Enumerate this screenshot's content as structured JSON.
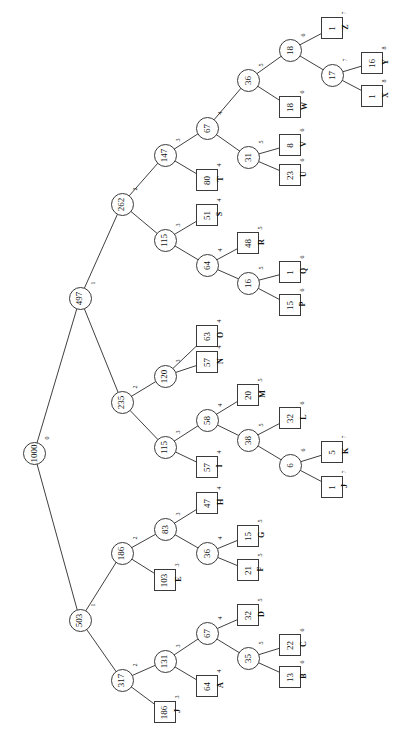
{
  "diagram": {
    "orientation": "rotated-90-ccw",
    "node_stroke": "#3a3a3a",
    "edge_stroke": "#2a2a2a",
    "background": "#ffffff",
    "text_color": "#111111"
  },
  "chart_data": {
    "type": "tree",
    "title": "",
    "root": "1000",
    "internal_shape": "circle",
    "leaf_shape": "square",
    "depth_label_note": "superscript number next to each node is its depth level",
    "nodes": [
      {
        "id": "n0",
        "value": "1000",
        "depth": "0",
        "kind": "internal",
        "x": 34,
        "y": 453
      },
      {
        "id": "n1",
        "value": "497",
        "depth": "1",
        "kind": "internal",
        "x": 80,
        "y": 298
      },
      {
        "id": "n2",
        "value": "503",
        "depth": "1",
        "kind": "internal",
        "x": 80,
        "y": 620
      },
      {
        "id": "n3",
        "value": "262",
        "depth": "2",
        "kind": "internal",
        "x": 122,
        "y": 204
      },
      {
        "id": "n4",
        "value": "235",
        "depth": "2",
        "kind": "internal",
        "x": 122,
        "y": 402
      },
      {
        "id": "n5",
        "value": "186",
        "depth": "2",
        "kind": "internal",
        "x": 122,
        "y": 553
      },
      {
        "id": "n6",
        "value": "317",
        "depth": "2",
        "kind": "internal",
        "x": 122,
        "y": 680
      },
      {
        "id": "n7",
        "value": "147",
        "depth": "3",
        "kind": "internal",
        "x": 165,
        "y": 155
      },
      {
        "id": "n8",
        "value": "115",
        "depth": "3",
        "kind": "internal",
        "x": 165,
        "y": 240
      },
      {
        "id": "n9",
        "value": "120",
        "depth": "3",
        "kind": "internal",
        "x": 165,
        "y": 376
      },
      {
        "id": "n10",
        "value": "115",
        "depth": "3",
        "kind": "internal",
        "x": 165,
        "y": 447
      },
      {
        "id": "n11",
        "value": "83",
        "depth": "3",
        "kind": "internal",
        "x": 165,
        "y": 529
      },
      {
        "id": "n12",
        "value": "103",
        "depth": "3",
        "kind": "leaf",
        "x": 165,
        "y": 580
      },
      {
        "id": "n13",
        "value": "131",
        "depth": "3",
        "kind": "internal",
        "x": 165,
        "y": 661
      },
      {
        "id": "n14",
        "value": "186",
        "depth": "3",
        "kind": "leaf",
        "x": 165,
        "y": 712
      },
      {
        "id": "n15",
        "value": "67",
        "depth": "4",
        "kind": "internal",
        "x": 207,
        "y": 128
      },
      {
        "id": "n16",
        "value": "80",
        "depth": "4",
        "kind": "leaf",
        "x": 207,
        "y": 180
      },
      {
        "id": "n17",
        "value": "51",
        "depth": "4",
        "kind": "leaf",
        "x": 207,
        "y": 215
      },
      {
        "id": "n18",
        "value": "64",
        "depth": "4",
        "kind": "internal",
        "x": 207,
        "y": 265
      },
      {
        "id": "n19",
        "value": "63",
        "depth": "4",
        "kind": "leaf",
        "x": 207,
        "y": 336
      },
      {
        "id": "n20",
        "value": "57",
        "depth": "4",
        "kind": "leaf",
        "x": 207,
        "y": 362
      },
      {
        "id": "n21",
        "value": "58",
        "depth": "4",
        "kind": "internal",
        "x": 207,
        "y": 420
      },
      {
        "id": "n22",
        "value": "57",
        "depth": "4",
        "kind": "leaf",
        "x": 207,
        "y": 467
      },
      {
        "id": "n23",
        "value": "47",
        "depth": "4",
        "kind": "leaf",
        "x": 207,
        "y": 503
      },
      {
        "id": "n24",
        "value": "36",
        "depth": "4",
        "kind": "internal",
        "x": 207,
        "y": 553
      },
      {
        "id": "n25",
        "value": "67",
        "depth": "4",
        "kind": "internal",
        "x": 207,
        "y": 633
      },
      {
        "id": "n26",
        "value": "64",
        "depth": "4",
        "kind": "leaf",
        "x": 207,
        "y": 686
      },
      {
        "id": "n27",
        "value": "36",
        "depth": "5",
        "kind": "internal",
        "x": 248,
        "y": 80
      },
      {
        "id": "n28",
        "value": "31",
        "depth": "5",
        "kind": "internal",
        "x": 248,
        "y": 157
      },
      {
        "id": "n29",
        "value": "48",
        "depth": "5",
        "kind": "leaf",
        "x": 248,
        "y": 243
      },
      {
        "id": "n30",
        "value": "16",
        "depth": "5",
        "kind": "internal",
        "x": 248,
        "y": 283
      },
      {
        "id": "n31",
        "value": "20",
        "depth": "5",
        "kind": "leaf",
        "x": 248,
        "y": 395
      },
      {
        "id": "n32",
        "value": "38",
        "depth": "5",
        "kind": "internal",
        "x": 248,
        "y": 440
      },
      {
        "id": "n33",
        "value": "15",
        "depth": "5",
        "kind": "leaf",
        "x": 248,
        "y": 536
      },
      {
        "id": "n34",
        "value": "21",
        "depth": "5",
        "kind": "leaf",
        "x": 248,
        "y": 570
      },
      {
        "id": "n35",
        "value": "32",
        "depth": "5",
        "kind": "leaf",
        "x": 248,
        "y": 615
      },
      {
        "id": "n36",
        "value": "35",
        "depth": "5",
        "kind": "internal",
        "x": 248,
        "y": 658
      },
      {
        "id": "n37",
        "value": "18",
        "depth": "6",
        "kind": "internal",
        "x": 290,
        "y": 50
      },
      {
        "id": "n38",
        "value": "18",
        "depth": "6",
        "kind": "leaf",
        "x": 290,
        "y": 107
      },
      {
        "id": "n39",
        "value": "8",
        "depth": "6",
        "kind": "leaf",
        "x": 290,
        "y": 145
      },
      {
        "id": "n40",
        "value": "23",
        "depth": "6",
        "kind": "leaf",
        "x": 290,
        "y": 175
      },
      {
        "id": "n41",
        "value": "1",
        "depth": "6",
        "kind": "leaf",
        "x": 290,
        "y": 272
      },
      {
        "id": "n42",
        "value": "15",
        "depth": "6",
        "kind": "leaf",
        "x": 290,
        "y": 305
      },
      {
        "id": "n43",
        "value": "32",
        "depth": "6",
        "kind": "leaf",
        "x": 290,
        "y": 418
      },
      {
        "id": "n44",
        "value": "6",
        "depth": "6",
        "kind": "internal",
        "x": 290,
        "y": 465
      },
      {
        "id": "n45",
        "value": "22",
        "depth": "6",
        "kind": "leaf",
        "x": 290,
        "y": 645
      },
      {
        "id": "n46",
        "value": "13",
        "depth": "6",
        "kind": "leaf",
        "x": 290,
        "y": 677
      },
      {
        "id": "n47",
        "value": "1",
        "depth": "7",
        "kind": "leaf",
        "x": 332,
        "y": 28
      },
      {
        "id": "n48",
        "value": "17",
        "depth": "7",
        "kind": "internal",
        "x": 332,
        "y": 75
      },
      {
        "id": "n49",
        "value": "5",
        "depth": "7",
        "kind": "leaf",
        "x": 332,
        "y": 452
      },
      {
        "id": "n50",
        "value": "1",
        "depth": "7",
        "kind": "leaf",
        "x": 332,
        "y": 487
      },
      {
        "id": "n51",
        "value": "16",
        "depth": "8",
        "kind": "leaf",
        "x": 372,
        "y": 63
      },
      {
        "id": "n52",
        "value": "1",
        "depth": "8",
        "kind": "leaf",
        "x": 372,
        "y": 96
      }
    ],
    "edges": [
      [
        "n0",
        "n1"
      ],
      [
        "n0",
        "n2"
      ],
      [
        "n1",
        "n3"
      ],
      [
        "n1",
        "n4"
      ],
      [
        "n2",
        "n5"
      ],
      [
        "n2",
        "n6"
      ],
      [
        "n3",
        "n7"
      ],
      [
        "n3",
        "n8"
      ],
      [
        "n4",
        "n9"
      ],
      [
        "n4",
        "n10"
      ],
      [
        "n5",
        "n11"
      ],
      [
        "n5",
        "n12"
      ],
      [
        "n6",
        "n13"
      ],
      [
        "n6",
        "n14"
      ],
      [
        "n7",
        "n15"
      ],
      [
        "n7",
        "n16"
      ],
      [
        "n8",
        "n17"
      ],
      [
        "n8",
        "n18"
      ],
      [
        "n9",
        "n19"
      ],
      [
        "n9",
        "n20"
      ],
      [
        "n10",
        "n21"
      ],
      [
        "n10",
        "n22"
      ],
      [
        "n11",
        "n23"
      ],
      [
        "n11",
        "n24"
      ],
      [
        "n13",
        "n25"
      ],
      [
        "n13",
        "n26"
      ],
      [
        "n15",
        "n27"
      ],
      [
        "n15",
        "n28"
      ],
      [
        "n18",
        "n29"
      ],
      [
        "n18",
        "n30"
      ],
      [
        "n21",
        "n31"
      ],
      [
        "n21",
        "n32"
      ],
      [
        "n24",
        "n33"
      ],
      [
        "n24",
        "n34"
      ],
      [
        "n25",
        "n35"
      ],
      [
        "n25",
        "n36"
      ],
      [
        "n27",
        "n37"
      ],
      [
        "n27",
        "n38"
      ],
      [
        "n28",
        "n39"
      ],
      [
        "n28",
        "n40"
      ],
      [
        "n30",
        "n41"
      ],
      [
        "n30",
        "n42"
      ],
      [
        "n32",
        "n43"
      ],
      [
        "n32",
        "n44"
      ],
      [
        "n36",
        "n45"
      ],
      [
        "n36",
        "n46"
      ],
      [
        "n37",
        "n47"
      ],
      [
        "n37",
        "n48"
      ],
      [
        "n44",
        "n49"
      ],
      [
        "n44",
        "n50"
      ],
      [
        "n48",
        "n51"
      ],
      [
        "n48",
        "n52"
      ]
    ],
    "leaf_labels": [
      {
        "node": "n14",
        "label": "J",
        "x": 180,
        "y": 712
      },
      {
        "node": "n26",
        "label": "A",
        "x": 222,
        "y": 686
      },
      {
        "node": "n46",
        "label": "B",
        "x": 305,
        "y": 677
      },
      {
        "node": "n45",
        "label": "C",
        "x": 305,
        "y": 645
      },
      {
        "node": "n35",
        "label": "D",
        "x": 263,
        "y": 615
      },
      {
        "node": "n12",
        "label": "E",
        "x": 180,
        "y": 580
      },
      {
        "node": "n34",
        "label": "F",
        "x": 263,
        "y": 570
      },
      {
        "node": "n33",
        "label": "G",
        "x": 263,
        "y": 536
      },
      {
        "node": "n23",
        "label": "H",
        "x": 222,
        "y": 503
      },
      {
        "node": "n22",
        "label": "I",
        "x": 222,
        "y": 467
      },
      {
        "node": "n50",
        "label": "J",
        "x": 347,
        "y": 487
      },
      {
        "node": "n49",
        "label": "K",
        "x": 347,
        "y": 452
      },
      {
        "node": "n43",
        "label": "L",
        "x": 305,
        "y": 418
      },
      {
        "node": "n31",
        "label": "M",
        "x": 263,
        "y": 395
      },
      {
        "node": "n20",
        "label": "N",
        "x": 222,
        "y": 362
      },
      {
        "node": "n19",
        "label": "O",
        "x": 222,
        "y": 336
      },
      {
        "node": "n42",
        "label": "P",
        "x": 305,
        "y": 305
      },
      {
        "node": "n41",
        "label": "Q",
        "x": 305,
        "y": 272
      },
      {
        "node": "n29",
        "label": "R",
        "x": 263,
        "y": 243
      },
      {
        "node": "n17",
        "label": "S",
        "x": 222,
        "y": 215
      },
      {
        "node": "n16",
        "label": "T",
        "x": 222,
        "y": 180
      },
      {
        "node": "n40",
        "label": "U",
        "x": 305,
        "y": 175
      },
      {
        "node": "n39",
        "label": "V",
        "x": 305,
        "y": 145
      },
      {
        "node": "n38",
        "label": "W",
        "x": 305,
        "y": 107
      },
      {
        "node": "n52",
        "label": "X",
        "x": 387,
        "y": 96
      },
      {
        "node": "n51",
        "label": "Y",
        "x": 387,
        "y": 63
      },
      {
        "node": "n47",
        "label": "Z",
        "x": 347,
        "y": 28
      }
    ]
  }
}
